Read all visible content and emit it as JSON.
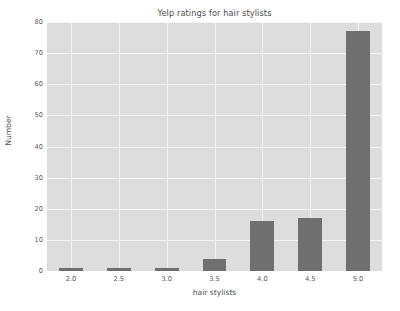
{
  "chart_data": {
    "type": "bar",
    "title": "Yelp ratings for hair stylists",
    "xlabel": "hair stylists",
    "ylabel": "Number",
    "categories": [
      "2.0",
      "2.5",
      "3.0",
      "3.5",
      "4.0",
      "4.5",
      "5.0"
    ],
    "values": [
      1,
      1,
      1,
      4,
      16,
      17,
      77
    ],
    "ylim": [
      0,
      80
    ],
    "yticks": [
      0,
      10,
      20,
      30,
      40,
      50,
      60,
      70,
      80
    ],
    "ytick_labels": [
      "0",
      "10",
      "20",
      "30",
      "40",
      "50",
      "60",
      "70",
      "80"
    ],
    "xtick_labels": [
      "2.0",
      "2.5",
      "3.0",
      "3.5",
      "4.0",
      "4.5",
      "5.0"
    ],
    "grid": true,
    "legend": null,
    "bar_color": "#6f6f6f",
    "plot_background": "#dddddd",
    "grid_color": "#f4f4f4",
    "figure_background": "#ffffff",
    "text_color": "#4d4d4d"
  }
}
